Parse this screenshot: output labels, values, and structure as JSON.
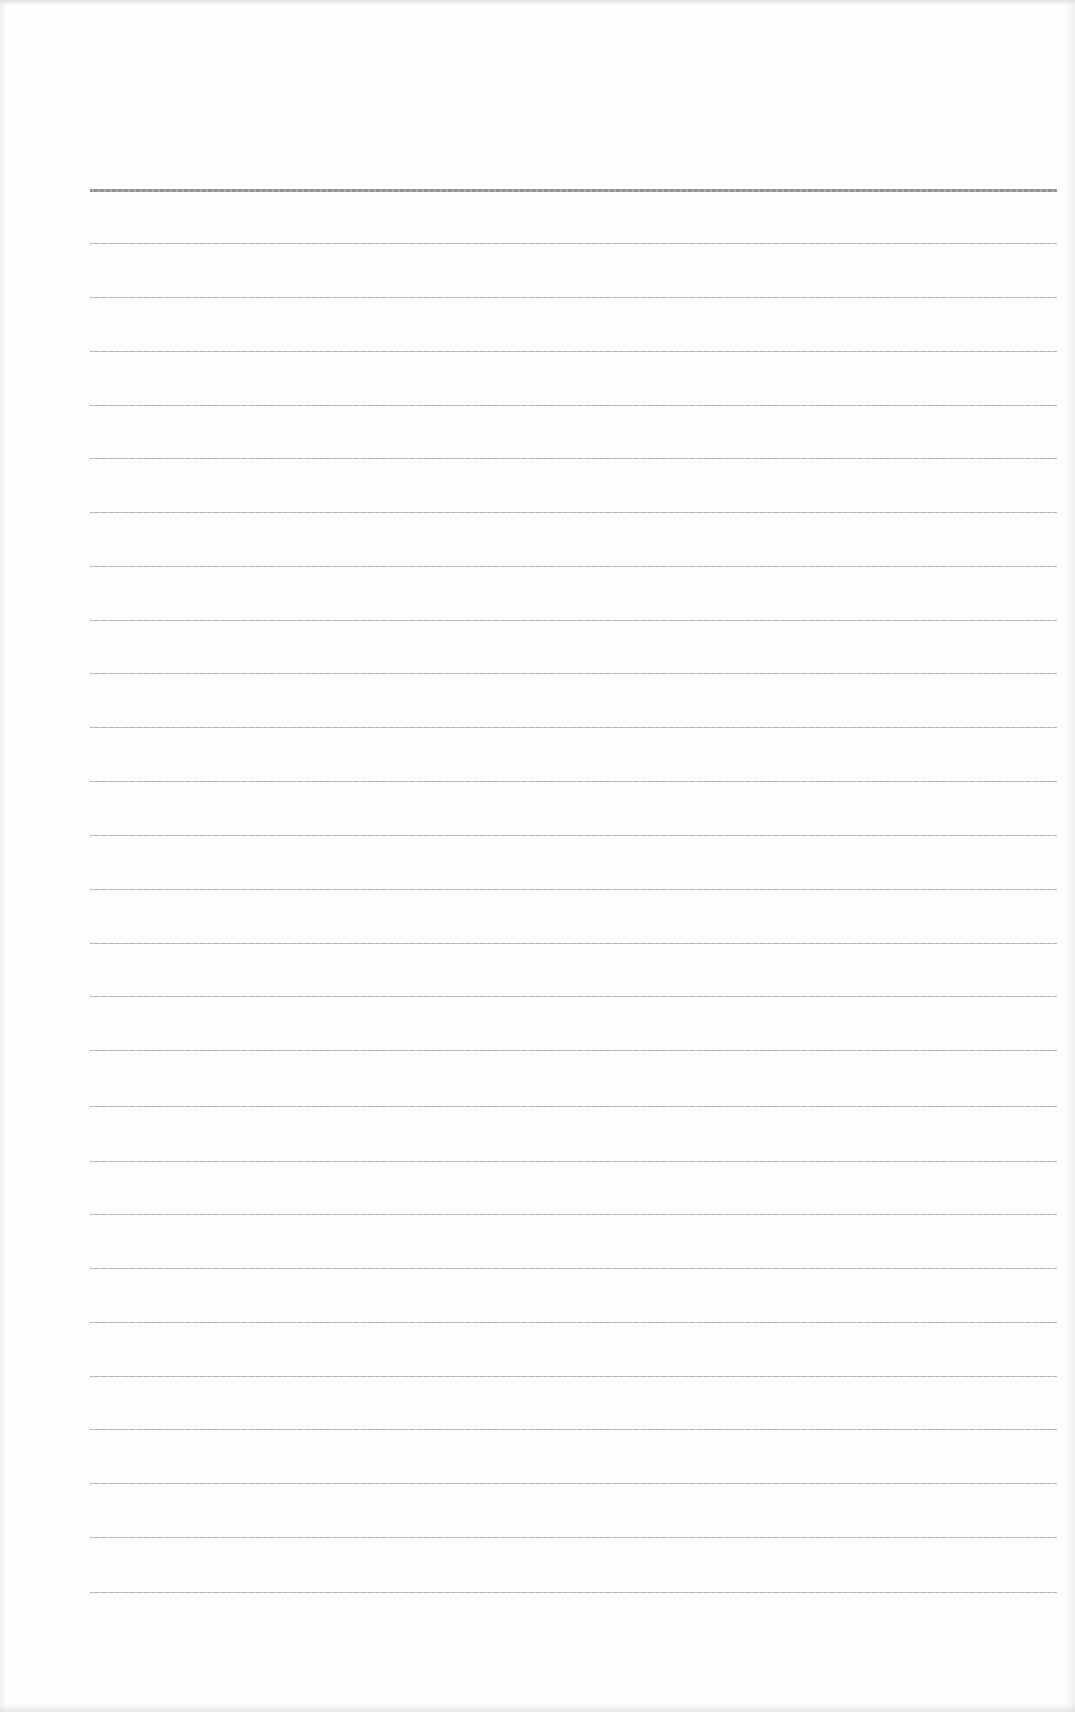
{
  "document": {
    "type": "ruled-paper",
    "background_color": "#fdfdfd",
    "line_color": "#a9a9a9",
    "header_line_color": "#8f8f8f",
    "margin_left_px": 90,
    "line_right_px": 1057,
    "lines": [
      {
        "y": 189,
        "style": "header"
      },
      {
        "y": 243,
        "style": "normal"
      },
      {
        "y": 297,
        "style": "normal"
      },
      {
        "y": 351,
        "style": "normal"
      },
      {
        "y": 405,
        "style": "normal"
      },
      {
        "y": 458,
        "style": "normal"
      },
      {
        "y": 512,
        "style": "normal"
      },
      {
        "y": 566,
        "style": "normal"
      },
      {
        "y": 620,
        "style": "normal"
      },
      {
        "y": 673,
        "style": "normal"
      },
      {
        "y": 727,
        "style": "normal"
      },
      {
        "y": 781,
        "style": "normal"
      },
      {
        "y": 835,
        "style": "normal"
      },
      {
        "y": 889,
        "style": "normal"
      },
      {
        "y": 943,
        "style": "normal"
      },
      {
        "y": 996,
        "style": "normal"
      },
      {
        "y": 1050,
        "style": "normal"
      },
      {
        "y": 1106,
        "style": "normal"
      },
      {
        "y": 1161,
        "style": "normal"
      },
      {
        "y": 1214,
        "style": "normal"
      },
      {
        "y": 1268,
        "style": "normal"
      },
      {
        "y": 1322,
        "style": "normal"
      },
      {
        "y": 1376,
        "style": "normal"
      },
      {
        "y": 1429,
        "style": "normal"
      },
      {
        "y": 1483,
        "style": "normal"
      },
      {
        "y": 1537,
        "style": "normal"
      },
      {
        "y": 1592,
        "style": "normal"
      }
    ]
  }
}
